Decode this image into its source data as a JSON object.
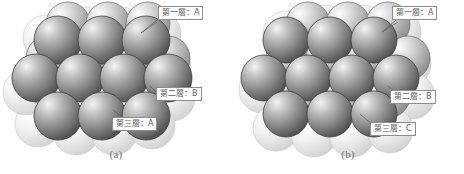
{
  "figure": {
    "background_color": "#ffffff",
    "panels": [
      {
        "id": "a",
        "caption": "(a)",
        "stacking": "ABA",
        "labels": [
          {
            "name": "layer-one",
            "text": "第一層：A"
          },
          {
            "name": "layer-two",
            "text": "第二層：B"
          },
          {
            "name": "layer-three",
            "text": "第三層：A"
          }
        ]
      },
      {
        "id": "b",
        "caption": "(b)",
        "stacking": "ABC",
        "labels": [
          {
            "name": "layer-one",
            "text": "第一層：A"
          },
          {
            "name": "layer-two",
            "text": "第二層：B"
          },
          {
            "name": "layer-three",
            "text": "第三層：C"
          }
        ]
      }
    ],
    "colors": {
      "sphere_back_light": "#f0f0f0",
      "sphere_back_dark": "#cfcfcf",
      "sphere_mid_light": "#e8e8e8",
      "sphere_mid_dark": "#8f8f8f",
      "sphere_front_light": "#e6e6e6",
      "sphere_front_dark": "#4e4e4e",
      "outline": "#4a4a4a",
      "label_border": "#8d8d8d",
      "label_text": "#5d5d5d",
      "caption_text": "#6f6f6f"
    }
  }
}
